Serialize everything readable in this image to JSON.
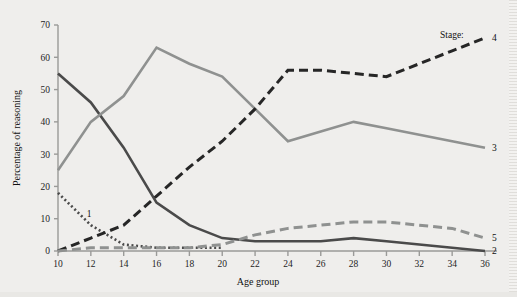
{
  "chart_data": {
    "type": "line",
    "title": "",
    "xlabel": "Age group",
    "ylabel": "Percentage of reasoning",
    "xlim": [
      10,
      36
    ],
    "ylim": [
      0,
      70
    ],
    "grid": false,
    "legend_position": "right-of-line-ends",
    "legend_prefix": "Stage:",
    "xticks": [
      10,
      12,
      14,
      16,
      18,
      20,
      22,
      24,
      26,
      28,
      30,
      32,
      34,
      36
    ],
    "yticks": [
      0,
      10,
      20,
      30,
      40,
      50,
      60,
      70
    ],
    "x": [
      10,
      12,
      14,
      16,
      18,
      20,
      22,
      24,
      26,
      28,
      30,
      32,
      34,
      36
    ],
    "series": [
      {
        "name": "1",
        "label": "1",
        "style": "dotted",
        "color": "#4a4a4a",
        "label_side": "inline",
        "values": [
          18,
          8,
          2,
          1,
          1,
          1,
          null,
          null,
          null,
          null,
          null,
          null,
          null,
          null
        ]
      },
      {
        "name": "2",
        "label": "2",
        "style": "solid",
        "color": "#4a4a4a",
        "label_side": "right",
        "values": [
          55,
          46,
          32,
          15,
          8,
          4,
          3,
          3,
          3,
          4,
          3,
          2,
          1,
          0
        ]
      },
      {
        "name": "3",
        "label": "3",
        "style": "solid",
        "color": "#8f9190",
        "label_side": "right",
        "values": [
          25,
          40,
          48,
          63,
          58,
          54,
          44,
          34,
          37,
          40,
          38,
          36,
          34,
          32
        ]
      },
      {
        "name": "4",
        "label": "4",
        "style": "dashed",
        "color": "#262626",
        "label_side": "right",
        "values": [
          0,
          4,
          8,
          17,
          26,
          34,
          44,
          56,
          56,
          55,
          54,
          58,
          62,
          66
        ]
      },
      {
        "name": "5",
        "label": "5",
        "style": "dashed",
        "color": "#8f9190",
        "label_side": "right",
        "values": [
          0,
          1,
          1,
          1,
          1,
          2,
          5,
          7,
          8,
          9,
          9,
          8,
          7,
          4
        ]
      }
    ]
  },
  "colors": {
    "background": "#efeeec",
    "axis": "#9a9a98",
    "text": "#1d1d1d",
    "series_dark": "#4a4a4a",
    "series_gray": "#8f9190",
    "series_black": "#262626"
  }
}
